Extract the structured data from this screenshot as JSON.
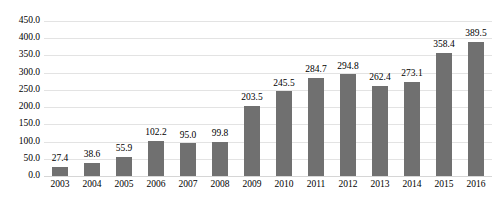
{
  "chart_data": {
    "type": "bar",
    "title": "",
    "xlabel": "",
    "ylabel": "",
    "categories": [
      "2003",
      "2004",
      "2005",
      "2006",
      "2007",
      "2008",
      "2009",
      "2010",
      "2011",
      "2012",
      "2013",
      "2014",
      "2015",
      "2016"
    ],
    "values": [
      27.4,
      38.6,
      55.9,
      102.2,
      95.0,
      99.8,
      203.5,
      245.5,
      284.7,
      294.8,
      262.4,
      273.1,
      358.4,
      389.5
    ],
    "data_labels": [
      "27.4",
      "38.6",
      "55.9",
      "102.2",
      "95.0",
      "99.8",
      "203.5",
      "245.5",
      "284.7",
      "294.8",
      "262.4",
      "273.1",
      "358.4",
      "389.5"
    ],
    "ylim": [
      0,
      450
    ],
    "ytick_step": 50,
    "ytick_labels": [
      "0.0",
      "50.0",
      "100.0",
      "150.0",
      "200.0",
      "250.0",
      "300.0",
      "350.0",
      "400.0",
      "450.0"
    ],
    "ytick_values": [
      0,
      50,
      100,
      150,
      200,
      250,
      300,
      350,
      400,
      450
    ],
    "grid": true,
    "legend": false,
    "legend_position": "none",
    "series": [
      {
        "name": "",
        "values": [
          27.4,
          38.6,
          55.9,
          102.2,
          95.0,
          99.8,
          203.5,
          245.5,
          284.7,
          294.8,
          262.4,
          273.1,
          358.4,
          389.5
        ]
      }
    ]
  },
  "style": {
    "bar_color": "#707070",
    "gridline_color": "#e3e3e3",
    "baseline_color": "#d6d6d6",
    "text_color": "#000000",
    "background": "#ffffff"
  },
  "title_fragment": ""
}
